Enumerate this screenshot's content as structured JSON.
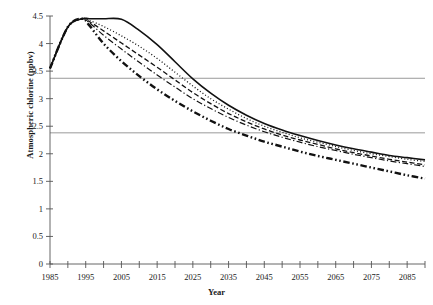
{
  "chart_data": {
    "type": "line",
    "title": "",
    "xlabel": "Year",
    "ylabel": "Atmospheric chlorine (ppbv)",
    "xlim": [
      1985,
      2090
    ],
    "ylim": [
      0,
      4.5
    ],
    "ytick_step": 0.5,
    "xtick_step": 5,
    "xtick_label_step": 10,
    "grid": false,
    "legend": "none",
    "y_ticks": [
      "0",
      "0.5",
      "1",
      "1.5",
      "2",
      "2.5",
      "3",
      "3.5",
      "4",
      "4.5"
    ],
    "x_ticks": [
      1985,
      1990,
      1995,
      2000,
      2005,
      2010,
      2015,
      2020,
      2025,
      2030,
      2035,
      2040,
      2045,
      2050,
      2055,
      2060,
      2065,
      2070,
      2075,
      2080,
      2085,
      2090
    ],
    "x_tick_labels": [
      "1985",
      "",
      "1995",
      "",
      "2005",
      "",
      "2015",
      "",
      "2025",
      "",
      "2035",
      "",
      "2045",
      "",
      "2055",
      "",
      "2065",
      "",
      "2075",
      "",
      "2085",
      ""
    ],
    "reference_lines": [
      {
        "name": "upper-reference-line",
        "value": 3.37,
        "color": "#808080"
      },
      {
        "name": "lower-reference-line",
        "value": 2.38,
        "color": "#808080"
      }
    ],
    "x": [
      1985,
      1990,
      1994,
      1996,
      2000,
      2005,
      2010,
      2015,
      2020,
      2025,
      2030,
      2035,
      2040,
      2045,
      2050,
      2055,
      2060,
      2065,
      2070,
      2075,
      2080,
      2085,
      2090
    ],
    "series": [
      {
        "name": "scenario-solid",
        "style": "solid",
        "width": 1.6,
        "color": "#111111",
        "values": [
          3.55,
          4.3,
          4.45,
          4.45,
          4.45,
          4.44,
          4.24,
          3.98,
          3.67,
          3.36,
          3.1,
          2.88,
          2.7,
          2.55,
          2.43,
          2.33,
          2.24,
          2.16,
          2.09,
          2.03,
          1.97,
          1.93,
          1.89
        ]
      },
      {
        "name": "scenario-dotted",
        "style": "dotted",
        "width": 1.3,
        "color": "#111111",
        "values": [
          3.55,
          4.3,
          4.45,
          4.42,
          4.31,
          4.14,
          3.95,
          3.73,
          3.48,
          3.23,
          3.0,
          2.81,
          2.64,
          2.5,
          2.39,
          2.29,
          2.21,
          2.13,
          2.06,
          2.0,
          1.95,
          1.9,
          1.86
        ]
      },
      {
        "name": "scenario-dashed",
        "style": "dashed",
        "width": 1.3,
        "color": "#111111",
        "values": [
          3.55,
          4.3,
          4.45,
          4.4,
          4.23,
          4.01,
          3.79,
          3.57,
          3.34,
          3.11,
          2.91,
          2.73,
          2.58,
          2.45,
          2.34,
          2.25,
          2.17,
          2.09,
          2.02,
          1.96,
          1.9,
          1.85,
          1.8
        ]
      },
      {
        "name": "scenario-dash-dot-thin",
        "style": "dash-dot",
        "width": 1.2,
        "color": "#111111",
        "values": [
          3.55,
          4.3,
          4.45,
          4.38,
          4.15,
          3.9,
          3.66,
          3.43,
          3.21,
          3.0,
          2.82,
          2.66,
          2.52,
          2.4,
          2.3,
          2.21,
          2.13,
          2.06,
          1.99,
          1.93,
          1.87,
          1.82,
          1.77
        ]
      },
      {
        "name": "scenario-dash-dot-dot-thick",
        "style": "dash-dot-dot",
        "width": 2.4,
        "color": "#111111",
        "values": [
          3.55,
          4.3,
          4.45,
          4.33,
          4.0,
          3.68,
          3.41,
          3.17,
          2.96,
          2.77,
          2.6,
          2.45,
          2.33,
          2.22,
          2.13,
          2.04,
          1.96,
          1.89,
          1.82,
          1.75,
          1.68,
          1.61,
          1.55
        ]
      }
    ]
  },
  "axis": {
    "x_title": "Year",
    "y_title": "Atmospheric chlorine (ppbv)"
  }
}
